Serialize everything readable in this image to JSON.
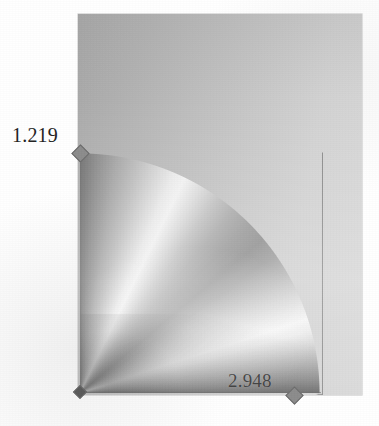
{
  "figure": {
    "kind": "quarter-sector-radial-shading-plot",
    "background_color": "#ffffff",
    "plot_fill_color": "#bcbcbc",
    "sector_outline_color": "#5a5a5a",
    "vertex_marker_color": "#8c8c8c",
    "label_color": "#2a2a2a"
  },
  "labels": {
    "radius": "1.219",
    "width": "2.948",
    "apex": ""
  },
  "chart_data": {
    "type": "heatmap",
    "title": "",
    "xlabel": "",
    "ylabel": "",
    "annotations": [
      "1.219",
      "2.948"
    ],
    "geometry": {
      "shape": "quarter circle sector",
      "apex": "bottom-left",
      "sweep_degrees": 90,
      "radius_label": "1.219",
      "span_label": "2.948"
    },
    "legend": []
  }
}
